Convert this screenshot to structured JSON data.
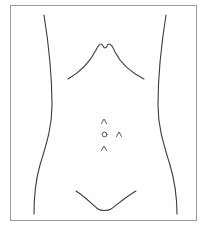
{
  "diagram": {
    "type": "anatomical-outline",
    "colors": {
      "frame": "#9a9a9a",
      "outline": "#3a3a3a",
      "marker": "#444444",
      "background": "#ffffff"
    },
    "parts": [
      {
        "name": "left-flank",
        "label": ""
      },
      {
        "name": "right-flank",
        "label": ""
      },
      {
        "name": "costal-margin",
        "label": ""
      },
      {
        "name": "pubic-line",
        "label": ""
      }
    ],
    "markers": [
      {
        "id": "upper-midline",
        "symbol": "caret",
        "x": 104,
        "y": 121
      },
      {
        "id": "umbilicus",
        "symbol": "circle",
        "x": 104,
        "y": 134
      },
      {
        "id": "right-lateral",
        "symbol": "caret",
        "x": 119,
        "y": 134
      },
      {
        "id": "lower-midline",
        "symbol": "caret",
        "x": 104,
        "y": 148
      }
    ]
  }
}
